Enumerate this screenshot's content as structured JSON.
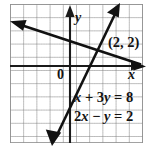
{
  "figure": {
    "kind": "coordinate-grid-graph",
    "background": "#ffffff",
    "grid": {
      "major_color": "#8d8d8d",
      "minor_color": "#b9b9b9",
      "cell_px": 13.2,
      "left": 10,
      "top": 4,
      "right": 143,
      "bottom": 143
    },
    "axes": {
      "color": "#1a1a1a",
      "x_label": "x",
      "y_label": "y",
      "origin_label": "0",
      "x_axis_y": 66,
      "y_axis_x": 70
    },
    "lines": {
      "color": "#111111",
      "line1_label": "x + 3y = 8",
      "line2_label": "2x − y = 2"
    },
    "point": {
      "label": "(2, 2)",
      "x": 2,
      "y": 2
    }
  },
  "equations": {
    "first": {
      "term1": "x",
      "plus": " + ",
      "coef2": "3",
      "var2": "y",
      "equals": " = ",
      "rhs": "8",
      "full": "x + 3y = 8"
    },
    "second": {
      "coef1": "2",
      "var1": "x",
      "minus": " − ",
      "var2": "y",
      "equals": " = ",
      "rhs": "2",
      "full": "2x − y = 2"
    }
  },
  "labels": {
    "y_axis": "y",
    "x_axis": "x",
    "origin": "0",
    "intersection": "(2, 2)"
  }
}
